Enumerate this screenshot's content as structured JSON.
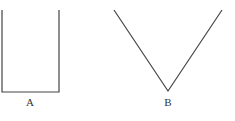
{
  "figure": {
    "shape_a": {
      "label": "A",
      "type": "open-rectangle (U-shape)"
    },
    "shape_b": {
      "label": "B",
      "type": "V-shape"
    },
    "stroke_color": "#444444"
  }
}
